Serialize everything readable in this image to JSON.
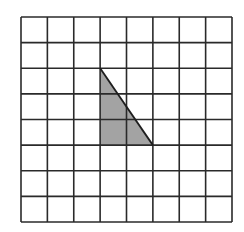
{
  "diagram": {
    "type": "grid-with-shape",
    "background": "#ffffff",
    "grid": {
      "columns": 8,
      "rows": 8,
      "left": 21,
      "top": 17,
      "right": 232,
      "bottom": 222,
      "line_color": "#2a2a2a",
      "line_width": 1.6
    },
    "shape": {
      "type": "right-triangle",
      "fill": "#a3a3a3",
      "stroke": "#1e1e1e",
      "vertices_grid": [
        [
          3,
          2
        ],
        [
          3,
          5
        ],
        [
          5,
          5
        ]
      ],
      "width_cells": 2,
      "height_cells": 3
    }
  }
}
